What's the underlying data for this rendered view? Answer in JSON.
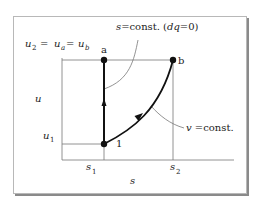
{
  "figure": {
    "axes": {
      "xlabel": "s",
      "ylabel": "u",
      "x_ticks": [
        "s1",
        "s2"
      ],
      "y_ticks": [
        "u1",
        "u2"
      ]
    },
    "labels": {
      "u_top": "u",
      "u_top_eq": "u₂ = uₐ = u_b",
      "u2_text": "u",
      "u2_sub": "2",
      "eq1": "=",
      "ua_text": "u",
      "ua_sub": "a",
      "eq2": "=",
      "ub_text": "u",
      "ub_sub": "b",
      "u_axis": "u",
      "u1_text": "u",
      "u1_sub": "1",
      "s1_text": "s",
      "s1_sub": "1",
      "s2_text": "s",
      "s2_sub": "2",
      "s_axis": "s",
      "s_const_s": "s",
      "s_const_rest": "=const. (",
      "s_const_dq": "dq",
      "s_const_end": "=0)",
      "v_const_v": "v",
      "v_const_rest": " =const."
    },
    "points": [
      {
        "name": "a",
        "label": "a"
      },
      {
        "name": "b",
        "label": "b"
      },
      {
        "name": "1",
        "label": "1"
      }
    ],
    "paths": [
      {
        "from": "1",
        "to": "a",
        "type": "isentropic (s = const.)"
      },
      {
        "from": "1",
        "to": "b",
        "type": "isochoric (v = const.)"
      }
    ]
  }
}
